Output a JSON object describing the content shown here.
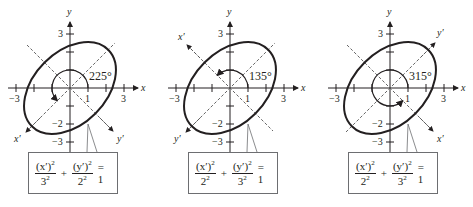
{
  "figure": {
    "unit_px": 18,
    "panels": [
      {
        "id": "panel-225",
        "origin_x": 70,
        "angle_label": "225°",
        "rotation_deg": 225,
        "x_prime_label": "x′",
        "y_prime_label": "y′",
        "x_prime_end": "lower-left",
        "y_prime_end": "lower-right",
        "equation": {
          "num1": "(x′)",
          "den1": "3",
          "num2": "(y′)",
          "den2": "2",
          "rhs": "= 1"
        }
      },
      {
        "id": "panel-135",
        "origin_x": 230,
        "angle_label": "135°",
        "rotation_deg": 135,
        "x_prime_label": "x′",
        "y_prime_label": "y′",
        "x_prime_end": "upper-left",
        "y_prime_end": "lower-left",
        "equation": {
          "num1": "(x′)",
          "den1": "2",
          "num2": "(y′)",
          "den2": "3",
          "rhs": "= 1"
        }
      },
      {
        "id": "panel-315",
        "origin_x": 390,
        "angle_label": "315°",
        "rotation_deg": 315,
        "x_prime_label": "x′",
        "y_prime_label": "y′",
        "x_prime_end": "lower-right",
        "y_prime_end": "upper-right",
        "equation": {
          "num1": "(x′)",
          "den1": "2",
          "num2": "(y′)",
          "den2": "3",
          "rhs": "= 1"
        }
      }
    ],
    "axes": {
      "x_label": "x",
      "y_label": "y",
      "x_tick_labels": {
        "neg3": "−3",
        "one": "1",
        "three": "3"
      },
      "y_tick_labels": {
        "three": "3",
        "neg2": "−2",
        "neg3": "−3"
      }
    },
    "ellipse": {
      "semi_major": 3,
      "semi_minor": 2,
      "major_axis_direction_deg": 45
    },
    "exponent": "2",
    "colors": {
      "ink": "#231f20",
      "box_border": "#6d6e71",
      "dashed": "#555555"
    }
  }
}
